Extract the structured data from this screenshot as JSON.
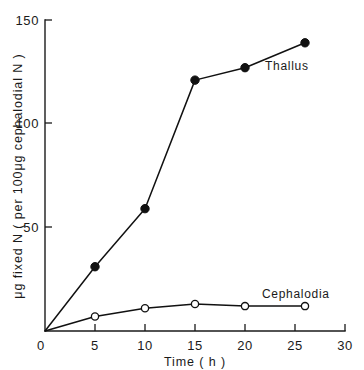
{
  "chart_data": {
    "type": "line",
    "title": "",
    "xlabel": "Time ( h )",
    "ylabel": "μg fixed N ( per 100μg cephalodial N )",
    "xlim": [
      0,
      30
    ],
    "ylim": [
      0,
      150
    ],
    "xticks": [
      "0",
      "5",
      "10",
      "15",
      "20",
      "25",
      "30"
    ],
    "xtick_values": [
      0,
      5,
      10,
      15,
      20,
      25,
      30
    ],
    "yticks": [
      "0",
      "50",
      "100",
      "150"
    ],
    "ytick_values": [
      0,
      50,
      100,
      150
    ],
    "grid": false,
    "legend_position": "inline-annotations",
    "series": [
      {
        "name": "Thallus",
        "marker": "filled-circle",
        "x": [
          0,
          5,
          10,
          15,
          20,
          26
        ],
        "values": [
          0,
          31,
          59,
          121,
          127,
          139
        ]
      },
      {
        "name": "Cephalodia",
        "marker": "open-circle",
        "x": [
          0,
          5,
          10,
          15,
          20,
          26
        ],
        "values": [
          0,
          7,
          11,
          13,
          12,
          12
        ]
      }
    ],
    "annotations": [
      {
        "text": "Thallus",
        "x": 26.2,
        "y": 128
      },
      {
        "text": "Cephalodia",
        "x": 24.6,
        "y": 22
      }
    ]
  },
  "colors": {
    "ink": "#111111",
    "background": "#ffffff"
  }
}
